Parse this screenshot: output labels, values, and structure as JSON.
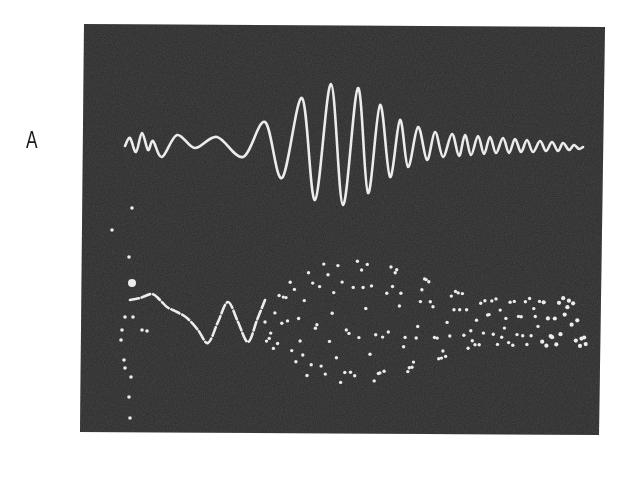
{
  "figure": {
    "panel_label": "A",
    "background_color": "#ffffff",
    "screen_color": "#2a2a2a",
    "trace_color": "#ececec"
  },
  "chart_data": {
    "type": "line",
    "title": "",
    "xlabel": "",
    "ylabel": "",
    "grid": false,
    "legend": null,
    "panel": "A",
    "screen_bounds_px": {
      "left": 82,
      "top": 24,
      "right": 602,
      "bottom": 434
    },
    "series": [
      {
        "name": "upper trace (continuous)",
        "style": "solid",
        "baseline_y": 146,
        "extrema_px": [
          [
            125,
            146
          ],
          [
            130,
            138
          ],
          [
            136,
            152
          ],
          [
            142,
            133
          ],
          [
            148,
            150
          ],
          [
            153,
            141
          ],
          [
            162,
            157
          ],
          [
            177,
            135
          ],
          [
            195,
            148
          ],
          [
            217,
            137
          ],
          [
            243,
            157
          ],
          [
            265,
            122
          ],
          [
            282,
            178
          ],
          [
            302,
            98
          ],
          [
            315,
            200
          ],
          [
            331,
            84
          ],
          [
            343,
            205
          ],
          [
            358,
            88
          ],
          [
            368,
            193
          ],
          [
            380,
            105
          ],
          [
            390,
            177
          ],
          [
            400,
            120
          ],
          [
            408,
            167
          ],
          [
            418,
            127
          ],
          [
            427,
            160
          ],
          [
            435,
            132
          ],
          [
            443,
            157
          ],
          [
            452,
            134
          ],
          [
            459,
            156
          ],
          [
            465,
            135
          ],
          [
            471,
            155
          ],
          [
            478,
            136
          ],
          [
            484,
            154
          ],
          [
            490,
            137
          ],
          [
            496,
            153
          ],
          [
            503,
            138
          ],
          [
            509,
            153
          ],
          [
            515,
            139
          ],
          [
            521,
            152
          ],
          [
            527,
            140
          ],
          [
            533,
            152
          ],
          [
            540,
            141
          ],
          [
            546,
            151
          ],
          [
            552,
            142
          ],
          [
            558,
            151
          ],
          [
            563,
            143
          ],
          [
            569,
            150
          ],
          [
            574,
            145
          ],
          [
            579,
            149
          ],
          [
            583,
            147
          ]
        ]
      },
      {
        "name": "lower trace (sampled / dotted)",
        "style": "dots",
        "baseline_y": 322,
        "solid_segment_px": [
          [
            130,
            300
          ],
          [
            140,
            298
          ],
          [
            152,
            294
          ],
          [
            160,
            300
          ],
          [
            167,
            307
          ],
          [
            177,
            312
          ],
          [
            187,
            318
          ],
          [
            198,
            330
          ],
          [
            208,
            343
          ],
          [
            218,
            322
          ],
          [
            228,
            302
          ],
          [
            238,
            322
          ],
          [
            248,
            342
          ],
          [
            257,
            320
          ],
          [
            265,
            300
          ]
        ],
        "dotted_wave": {
          "x_start": 265,
          "x_end": 585,
          "dot_spacing_px": 4.2,
          "components": [
            {
              "period_px": 34,
              "amplitude_px": 62,
              "phase": 0.0
            },
            {
              "period_px": 29,
              "amplitude_px": 58,
              "phase": 1.7
            }
          ],
          "envelope_peak_x": 355,
          "envelope_width_px": 150,
          "end_amplitude_px": 24
        },
        "extra_marks_px": [
          [
            132,
            208
          ],
          [
            112,
            230
          ],
          [
            129,
            257
          ],
          [
            132,
            283
          ],
          [
            125,
            317
          ],
          [
            133,
            317
          ],
          [
            122,
            330
          ],
          [
            121,
            340
          ],
          [
            124,
            360
          ],
          [
            125,
            368
          ],
          [
            131,
            377
          ],
          [
            129,
            397
          ],
          [
            130,
            418
          ],
          [
            142,
            330
          ],
          [
            147,
            331
          ]
        ]
      }
    ]
  }
}
